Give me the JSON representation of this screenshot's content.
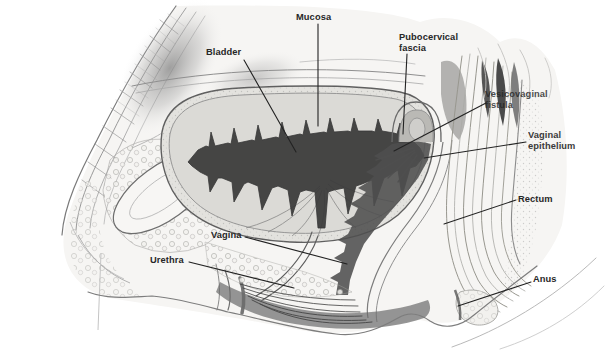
{
  "palette": {
    "background": "#ffffff",
    "label_ink": "#272727",
    "leader_line": "#222222",
    "sketch_dark": "#3a3a3a",
    "sketch_mid": "#8f8f8f",
    "sketch_light": "#d8d8d8"
  },
  "labels": [
    {
      "id": "mucosa",
      "text": "Mucosa"
    },
    {
      "id": "bladder",
      "text": "Bladder"
    },
    {
      "id": "pubocervical-fascia",
      "text": "Pubocervical fascia"
    },
    {
      "id": "vesicovaginal-fistula",
      "text": "Vesicovaginal fistula"
    },
    {
      "id": "vaginal-epithelium",
      "text": "Vaginal epithelium"
    },
    {
      "id": "rectum",
      "text": "Rectum"
    },
    {
      "id": "vagina",
      "text": "Vagina"
    },
    {
      "id": "urethra",
      "text": "Urethra"
    },
    {
      "id": "anus",
      "text": "Anus"
    }
  ]
}
